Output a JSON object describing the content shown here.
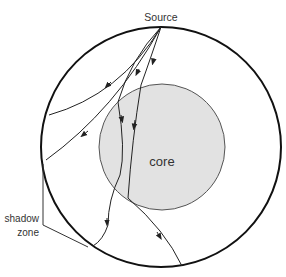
{
  "labels": {
    "source": "Source",
    "core": "core",
    "shadow_line1": "shadow",
    "shadow_line2": "zone"
  },
  "colors": {
    "outline": "#111111",
    "core_fill": "#e2e2e2",
    "core_stroke": "#555555",
    "ray": "#222222",
    "text": "#333333"
  }
}
